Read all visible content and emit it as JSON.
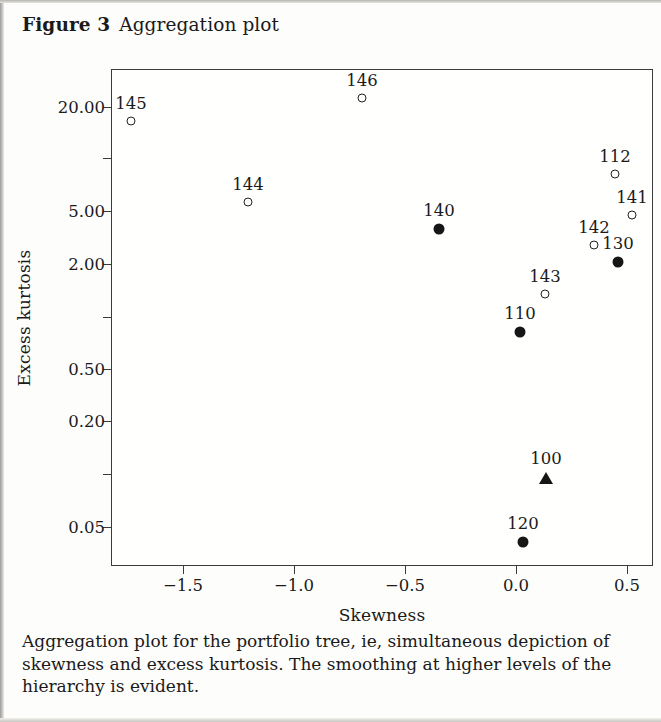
{
  "title": {
    "figure_label": "Figure 3",
    "figure_title": "Aggregation plot"
  },
  "caption": "Aggregation plot for the portfolio tree, ie, simultaneous depiction of skewness and excess kurtosis. The smoothing at higher levels of the hierarchy is evident.",
  "chart_data": {
    "type": "scatter",
    "title": "Aggregation plot",
    "xlabel": "Skewness",
    "ylabel": "Excess kurtosis",
    "yscale": "log",
    "xlim": [
      -1.83,
      0.62
    ],
    "ylim": [
      0.045,
      27.0
    ],
    "grid": false,
    "legend": null,
    "xticks": [
      -1.5,
      -1.0,
      -0.5,
      0.0,
      0.5
    ],
    "xtick_labels": [
      "−1.5",
      "−1.0",
      "−0.5",
      "0.0",
      "0.5"
    ],
    "yticks": [
      20.0,
      10.0,
      5.0,
      2.0,
      1.0,
      0.5,
      0.2,
      0.1,
      0.05
    ],
    "ytick_labels": [
      "20.00",
      "",
      "5.00",
      "2.00",
      "",
      "0.50",
      "0.20",
      "",
      "0.05"
    ],
    "marker_styles": {
      "open-circle": "leaf / lower-level node",
      "filled-circle": "aggregated node",
      "filled-triangle": "root node"
    },
    "points": [
      {
        "label": "145",
        "x": -1.675,
        "y": 17.5,
        "marker": "open-circle",
        "px": 130,
        "py": 120
      },
      {
        "label": "146",
        "x": -0.675,
        "y": 22.0,
        "marker": "open-circle",
        "px": 361,
        "py": 97
      },
      {
        "label": "144",
        "x": -1.195,
        "y": 5.5,
        "marker": "open-circle",
        "px": 247,
        "py": 201
      },
      {
        "label": "140",
        "x": -0.345,
        "y": 4.1,
        "marker": "filled-circle",
        "px": 438,
        "py": 228
      },
      {
        "label": "112",
        "x": 0.445,
        "y": 8.5,
        "marker": "open-circle",
        "px": 614,
        "py": 173
      },
      {
        "label": "141",
        "x": 0.52,
        "y": 4.7,
        "marker": "open-circle",
        "px": 631,
        "py": 214
      },
      {
        "label": "142",
        "x": 0.35,
        "y": 3.0,
        "marker": "open-circle",
        "px": 593,
        "py": 244
      },
      {
        "label": "130",
        "x": 0.46,
        "y": 2.5,
        "marker": "filled-circle",
        "px": 617,
        "py": 261
      },
      {
        "label": "143",
        "x": 0.13,
        "y": 1.85,
        "marker": "open-circle",
        "px": 544,
        "py": 293
      },
      {
        "label": "110",
        "x": 0.018,
        "y": 1.15,
        "marker": "filled-circle",
        "px": 519,
        "py": 331
      },
      {
        "label": "100",
        "x": 0.135,
        "y": 0.165,
        "marker": "filled-triangle",
        "px": 545,
        "py": 477
      },
      {
        "label": "120",
        "x": 0.032,
        "y": 0.072,
        "marker": "filled-circle",
        "px": 522,
        "py": 541
      }
    ],
    "xtick_px": [
      182,
      293,
      404,
      515,
      626
    ],
    "ytick_px": [
      106,
      157,
      210,
      263,
      316,
      368,
      420,
      473,
      526
    ],
    "plot_box_px": {
      "left": 111,
      "top": 69,
      "right": 653,
      "bottom": 566
    }
  }
}
